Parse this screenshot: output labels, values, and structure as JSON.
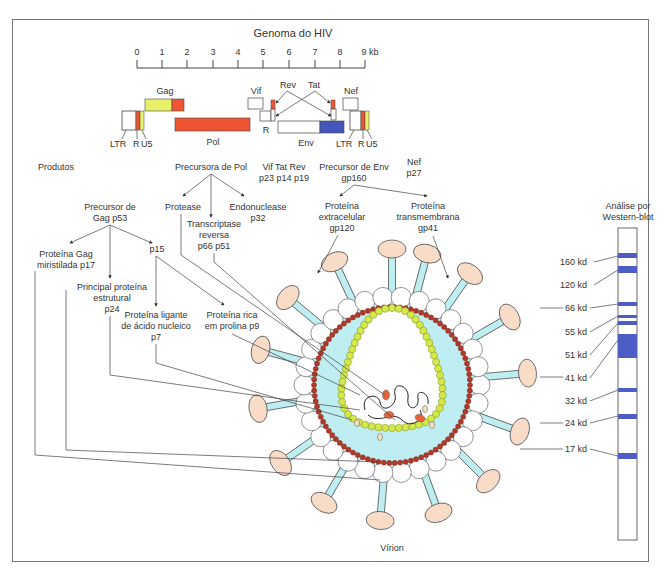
{
  "genome": {
    "title": "Genoma do HIV",
    "scale_ticks": [
      "0",
      "1",
      "2",
      "3",
      "4",
      "5",
      "6",
      "7",
      "8",
      "9 kb"
    ],
    "genes": {
      "gag": "Gag",
      "pol": "Pol",
      "vif": "Vif",
      "rev": "Rev",
      "tat": "Tat",
      "nef": "Nef",
      "env": "Env",
      "r": "R"
    },
    "ltr_left": [
      "LTR",
      "R",
      "U5"
    ],
    "ltr_right": [
      "LTR",
      "R",
      "U5"
    ]
  },
  "products": {
    "header": "Produtos",
    "pol_precursor": "Precursora de Pol",
    "vif_tat_rev_names": "Vif  Tat  Rev",
    "vif_tat_rev_sizes": "p23 p14 p19",
    "env_precursor_line1": "Precursor de Env",
    "env_precursor_line2": "gp160",
    "nef_line1": "Nef",
    "nef_line2": "p27",
    "gag_precursor_line1": "Precursor de",
    "gag_precursor_line2": "Gag p53",
    "protease": "Protease",
    "rt_line1": "Transcriptase",
    "rt_line2": "reversa",
    "rt_line3": "p66 p51",
    "endonuclease_line1": "Endonuclease",
    "endonuclease_line2": "p32",
    "gp120_line1": "Proteína",
    "gp120_line2": "extracelular",
    "gp120_line3": "gp120",
    "gp41_line1": "Proteína",
    "gp41_line2": "transmembrana",
    "gp41_line3": "gp41",
    "p17_line1": "Proteína Gag",
    "p17_line2": "miristilada p17",
    "p15": "p15",
    "p24_line1": "Principal proteína",
    "p24_line2": "estrutural",
    "p24_line3": "p24",
    "p7_line1": "Proteína ligante",
    "p7_line2": "de ácido nucleico",
    "p7_line3": "p7",
    "p9_line1": "Proteína rica",
    "p9_line2": "em prolina p9"
  },
  "western_blot": {
    "title_line1": "Análise por",
    "title_line2": "Western-blot",
    "bands": [
      "160 kd",
      "120 kd",
      "66 kd",
      "55 kd",
      "51 kd",
      "41 kd",
      "32 kd",
      "24 kd",
      "17 kd"
    ]
  },
  "virion": {
    "label": "Vírion"
  },
  "colors": {
    "gag_yellow": "#e8f06a",
    "red_orange": "#ee5533",
    "env_blue": "#4455bb",
    "capsid_cyan": "#bfeef2",
    "spike_head": "#f8dcc8",
    "matrix_red": "#b0392a",
    "core_green": "#d4e84a",
    "band_blue": "#4c5ec4"
  }
}
